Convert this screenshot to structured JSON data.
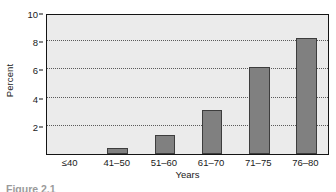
{
  "figure": {
    "caption_partial": "Figure 2.1",
    "background_color": "#ffffff"
  },
  "colors": {
    "plot_background": "#ebebeb",
    "bar_fill": "#808080",
    "bar_border": "#3d3d3d",
    "axis_line": "#141414",
    "gridline": "#5a5a5a",
    "text": "#1a1a1a"
  },
  "chart_data": {
    "type": "bar",
    "title": "",
    "xlabel": "Years",
    "ylabel": "Percent",
    "categories": [
      "≤40",
      "41–50",
      "51–60",
      "61–70",
      "71–75",
      "76–80"
    ],
    "values": [
      0,
      0.45,
      1.35,
      3.1,
      6.2,
      8.2
    ],
    "ylim": [
      0,
      10
    ],
    "yticks": [
      2,
      4,
      6,
      8,
      10
    ],
    "ytick_labels": [
      "2",
      "4",
      "6",
      "8",
      "10"
    ],
    "gridlines": [
      2,
      4,
      6,
      8
    ],
    "grid": true,
    "grid_style": "dotted",
    "legend": "none",
    "orientation": "vertical"
  }
}
